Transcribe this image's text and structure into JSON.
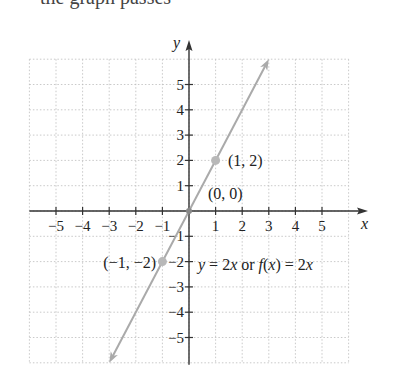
{
  "header": {
    "cropped_text": "the graph passes"
  },
  "chart_data": {
    "type": "line",
    "title": "",
    "xlabel": "x",
    "ylabel": "y",
    "xlim": [
      -6,
      6
    ],
    "ylim": [
      -6,
      6
    ],
    "grid": true,
    "grid_style": "dotted",
    "x_ticks": [
      -5,
      -4,
      -3,
      -2,
      -1,
      1,
      2,
      3,
      4,
      5
    ],
    "y_ticks": [
      -5,
      -4,
      -3,
      -2,
      -1,
      1,
      2,
      3,
      4,
      5
    ],
    "x_tick_labels": [
      "−5",
      "−4",
      "−3",
      "−2",
      "−1",
      "1",
      "2",
      "3",
      "4",
      "5"
    ],
    "y_tick_labels": [
      "−5",
      "−4",
      "−3",
      "−2",
      "−1",
      "1",
      "2",
      "3",
      "4",
      "5"
    ],
    "series": [
      {
        "name": "y = 2x or f(x) = 2x",
        "equation": "y = 2x",
        "slope": 2,
        "intercept": 0,
        "x": [
          -3,
          3
        ],
        "y": [
          -6,
          6
        ],
        "arrows_both_ends": true,
        "color": "#aaaaaa"
      }
    ],
    "points": [
      {
        "x": -1,
        "y": -2,
        "label": "(−1, −2)"
      },
      {
        "x": 0,
        "y": 0,
        "label": "(0, 0)"
      },
      {
        "x": 1,
        "y": 2,
        "label": "(1, 2)"
      }
    ],
    "annotations": [
      {
        "text_parts": [
          "y",
          " = 2",
          "x",
          " or ",
          "f",
          "(",
          "x",
          ") = 2",
          "x"
        ],
        "position": [
          0.7,
          -2.6
        ]
      }
    ]
  },
  "colors": {
    "axis": "#333333",
    "grid": "#bbbbbb",
    "line": "#aaaaaa",
    "text": "#222222"
  }
}
